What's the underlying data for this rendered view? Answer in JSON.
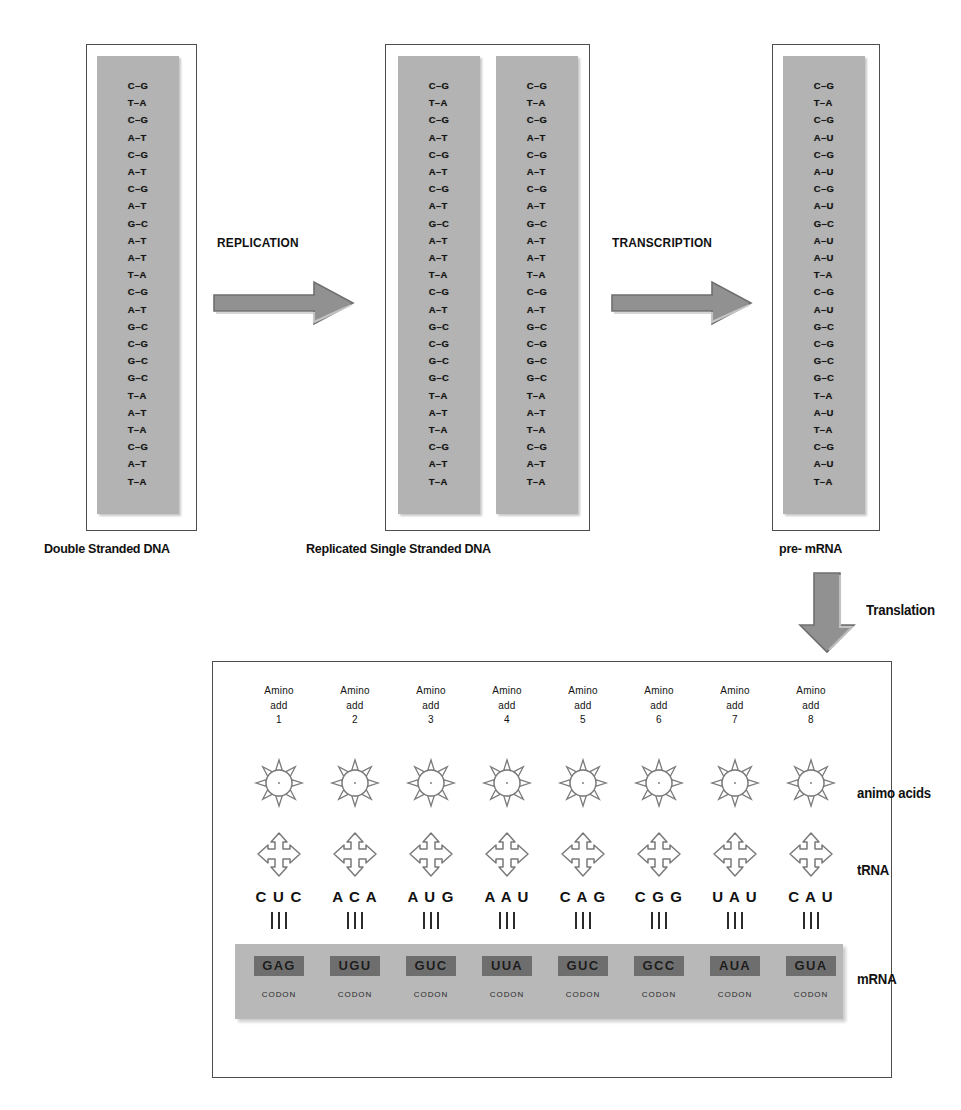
{
  "stages": {
    "dna": {
      "caption": "Double Stranded DNA",
      "pairs": [
        "C–G",
        "T–A",
        "C–G",
        "A–T",
        "C–G",
        "A–T",
        "C–G",
        "A–T",
        "G–C",
        "A–T",
        "A–T",
        "T–A",
        "C–G",
        "A–T",
        "G–C",
        "C–G",
        "G–C",
        "G–C",
        "T–A",
        "A–T",
        "T–A",
        "C–G",
        "A–T",
        "T–A"
      ]
    },
    "replicated": {
      "caption": "Replicated Single Stranded DNA",
      "strand_a": [
        "C–G",
        "T–A",
        "C–G",
        "A–T",
        "C–G",
        "A–T",
        "C–G",
        "A–T",
        "G–C",
        "A–T",
        "A–T",
        "T–A",
        "C–G",
        "A–T",
        "G–C",
        "C–G",
        "G–C",
        "G–C",
        "T–A",
        "A–T",
        "T–A",
        "C–G",
        "A–T",
        "T–A"
      ],
      "strand_b": [
        "C–G",
        "T–A",
        "C–G",
        "A–T",
        "C–G",
        "A–T",
        "C–G",
        "A–T",
        "G–C",
        "A–T",
        "A–T",
        "T–A",
        "C–G",
        "A–T",
        "G–C",
        "C–G",
        "G–C",
        "G–C",
        "T–A",
        "A–T",
        "T–A",
        "C–G",
        "A–T",
        "T–A"
      ]
    },
    "premrna": {
      "caption": "pre- mRNA",
      "pairs": [
        "C–G",
        "T–A",
        "C–G",
        "A–U",
        "C–G",
        "A–U",
        "C–G",
        "A–U",
        "G–C",
        "A–U",
        "A–U",
        "T–A",
        "C–G",
        "A–U",
        "G–C",
        "C–G",
        "G–C",
        "G–C",
        "T–A",
        "A–U",
        "T–A",
        "C–G",
        "A–U",
        "T–A"
      ]
    }
  },
  "arrows": {
    "replication_label": "REPLICATION",
    "transcription_label": "TRANSCRIPTION",
    "translation_label": "Translation"
  },
  "translation": {
    "row_labels": {
      "amino_acids": "animo acids",
      "trna": "tRNA",
      "mrna": "mRNA"
    },
    "codon_caption": "CODON",
    "columns": [
      {
        "head_line1": "Amino",
        "head_line2": "add",
        "number": "1",
        "anticodon": "C U C",
        "codon": "GAG",
        "codon_label": "CODON"
      },
      {
        "head_line1": "Amino",
        "head_line2": "add",
        "number": "2",
        "anticodon": "A C A",
        "codon": "UGU",
        "codon_label": "CODON"
      },
      {
        "head_line1": "Amino",
        "head_line2": "add",
        "number": "3",
        "anticodon": "A U G",
        "codon": "GUC",
        "codon_label": "CODON"
      },
      {
        "head_line1": "Amino",
        "head_line2": "add",
        "number": "4",
        "anticodon": "A A U",
        "codon": "UUA",
        "codon_label": "CODON"
      },
      {
        "head_line1": "Amino",
        "head_line2": "add",
        "number": "5",
        "anticodon": "C A G",
        "codon": "GUC",
        "codon_label": "CODON"
      },
      {
        "head_line1": "Amino",
        "head_line2": "add",
        "number": "6",
        "anticodon": "C G G",
        "codon": "GCC",
        "codon_label": "CODON"
      },
      {
        "head_line1": "Amino",
        "head_line2": "add",
        "number": "7",
        "anticodon": "U A U",
        "codon": "AUA",
        "codon_label": "CODON"
      },
      {
        "head_line1": "Amino",
        "head_line2": "add",
        "number": "8",
        "anticodon": "C A U",
        "codon": "GUA",
        "codon_label": "CODON"
      }
    ]
  },
  "colors": {
    "strand_fill": "#b3b3b3",
    "arrow_fill": "#8c8c8c",
    "codon_box": "#6e6e6e",
    "mrna_strip": "#b8b8b8",
    "outline": "#4d4d4d",
    "text": "#111111"
  }
}
